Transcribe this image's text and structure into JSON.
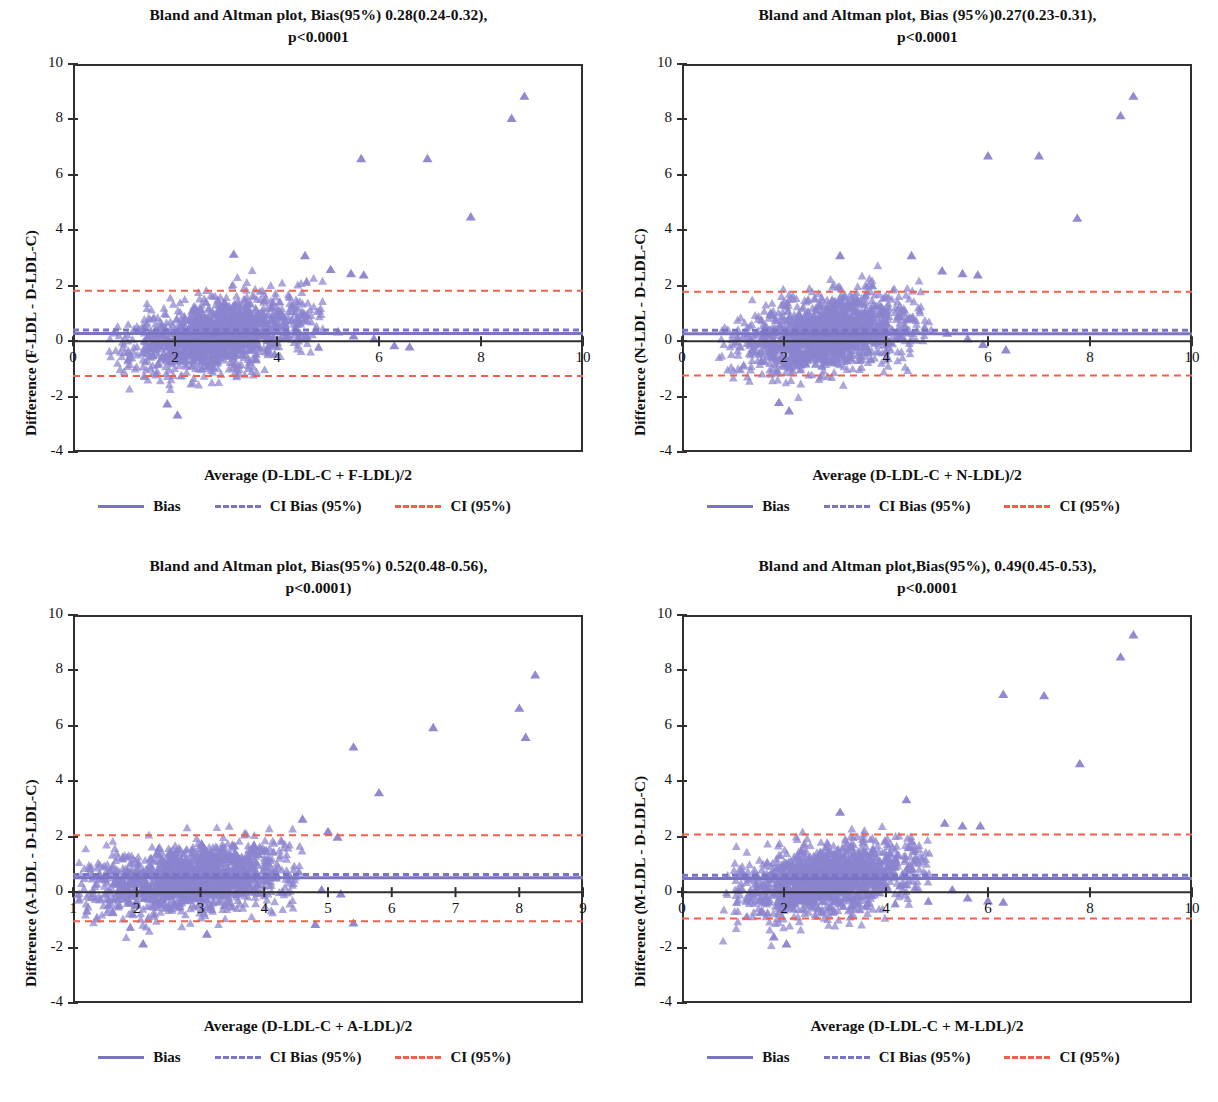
{
  "figure": {
    "panel_count": 4,
    "marker_shape": "triangle",
    "marker_color": "#8b84cf",
    "bias_color": "#7b74c4",
    "ci_bias_color": "#7b74c4",
    "ci_color": "#f0604a",
    "axis_color": "#2f2f33"
  },
  "legend": {
    "items": [
      {
        "label": "Bias",
        "style": "solid",
        "color": "#7b74c4",
        "name": "legend-bias"
      },
      {
        "label": "CI Bias (95%)",
        "style": "dashed",
        "color": "#7b74c4",
        "name": "legend-ci-bias"
      },
      {
        "label": "CI (95%)",
        "style": "dashed",
        "color": "#f0604a",
        "name": "legend-ci"
      }
    ]
  },
  "panels": [
    {
      "id": "f-ldl",
      "title_line1": "Bland and Altman plot, Bias(95%) 0.28(0.24-0.32),",
      "title_line2": "p<0.0001",
      "ylabel": "Difference (F-LDL - D-LDL-C)",
      "xlabel": "Average (D-LDL-C + F-LDL)/2",
      "xticks": [
        0,
        2,
        4,
        6,
        8,
        10
      ],
      "yticks": [
        -4,
        -2,
        0,
        2,
        4,
        6,
        8,
        10
      ],
      "xlim": [
        0,
        10
      ],
      "ylim": [
        -4,
        10
      ],
      "bias": 0.28,
      "bias_ci_low": 0.24,
      "bias_ci_high": 0.32,
      "p_value": "p<0.0001",
      "loa_upper": 1.82,
      "loa_lower": -1.26,
      "cluster": {
        "x_center": 2.9,
        "x_spread": 0.85,
        "x_min": 0.7,
        "x_max": 4.9,
        "slope": 0.3,
        "y_spread": 0.62,
        "n": 1500
      },
      "outliers": [
        {
          "x": 5.65,
          "y": 6.6
        },
        {
          "x": 6.95,
          "y": 6.6
        },
        {
          "x": 7.8,
          "y": 4.5
        },
        {
          "x": 8.6,
          "y": 8.05
        },
        {
          "x": 8.85,
          "y": 8.85
        },
        {
          "x": 5.05,
          "y": 2.6
        },
        {
          "x": 5.45,
          "y": 2.45
        },
        {
          "x": 5.7,
          "y": 2.4
        },
        {
          "x": 5.2,
          "y": 0.35
        },
        {
          "x": 5.5,
          "y": 0.2
        },
        {
          "x": 5.9,
          "y": 0.1
        },
        {
          "x": 6.3,
          "y": -0.15
        },
        {
          "x": 6.6,
          "y": -0.2
        },
        {
          "x": 4.55,
          "y": 3.1
        },
        {
          "x": 3.15,
          "y": 3.15
        },
        {
          "x": 2.05,
          "y": -2.65
        },
        {
          "x": 1.85,
          "y": -2.25
        }
      ]
    },
    {
      "id": "n-ldl",
      "title_line1": "Bland and Altman plot, Bias (95%)0.27(0.23-0.31),",
      "title_line2": "p<0.0001",
      "ylabel": "Difference (N-LDL - D-LDL-C)",
      "xlabel": "Average (D-LDL-C + N-LDL)/2",
      "xticks": [
        0,
        2,
        4,
        6,
        8,
        10
      ],
      "yticks": [
        -4,
        -2,
        0,
        2,
        4,
        6,
        8,
        10
      ],
      "xlim": [
        0,
        10
      ],
      "ylim": [
        -4,
        10
      ],
      "bias": 0.27,
      "bias_ci_low": 0.23,
      "bias_ci_high": 0.31,
      "p_value": "p<0.0001",
      "loa_upper": 1.78,
      "loa_lower": -1.24,
      "cluster": {
        "x_center": 2.85,
        "x_spread": 0.85,
        "x_min": 0.7,
        "x_max": 4.9,
        "slope": 0.3,
        "y_spread": 0.64,
        "n": 1500
      },
      "outliers": [
        {
          "x": 6.0,
          "y": 6.7
        },
        {
          "x": 7.0,
          "y": 6.7
        },
        {
          "x": 7.75,
          "y": 4.45
        },
        {
          "x": 8.6,
          "y": 8.15
        },
        {
          "x": 8.85,
          "y": 8.85
        },
        {
          "x": 5.1,
          "y": 2.55
        },
        {
          "x": 5.5,
          "y": 2.45
        },
        {
          "x": 5.8,
          "y": 2.4
        },
        {
          "x": 5.2,
          "y": 0.3
        },
        {
          "x": 5.6,
          "y": 0.1
        },
        {
          "x": 5.9,
          "y": -0.1
        },
        {
          "x": 6.35,
          "y": -0.3
        },
        {
          "x": 4.5,
          "y": 3.1
        },
        {
          "x": 3.1,
          "y": 3.1
        },
        {
          "x": 2.1,
          "y": -2.5
        },
        {
          "x": 1.9,
          "y": -2.2
        }
      ]
    },
    {
      "id": "a-ldl",
      "title_line1": "Bland and Altman plot, Bias(95%) 0.52(0.48-0.56),",
      "title_line2": "p<0.0001)",
      "ylabel": "Difference (A-LDL - D-LDL-C)",
      "xlabel": "Average (D-LDL-C + A-LDL)/2",
      "xticks": [
        1,
        2,
        3,
        4,
        5,
        6,
        7,
        8,
        9
      ],
      "yticks": [
        -4,
        -2,
        0,
        2,
        4,
        6,
        8,
        10
      ],
      "xlim": [
        1,
        9
      ],
      "ylim": [
        -4,
        10
      ],
      "bias": 0.52,
      "bias_ci_low": 0.48,
      "bias_ci_high": 0.56,
      "p_value": "p<0.0001)",
      "loa_upper": 2.05,
      "loa_lower": -1.05,
      "cluster": {
        "x_center": 2.85,
        "x_spread": 0.82,
        "x_min": 1.05,
        "x_max": 4.6,
        "slope": 0.22,
        "y_spread": 0.6,
        "n": 1500
      },
      "outliers": [
        {
          "x": 5.4,
          "y": 5.25
        },
        {
          "x": 6.65,
          "y": 5.95
        },
        {
          "x": 8.0,
          "y": 6.65
        },
        {
          "x": 8.25,
          "y": 7.85
        },
        {
          "x": 8.1,
          "y": 5.6
        },
        {
          "x": 5.8,
          "y": 3.6
        },
        {
          "x": 4.6,
          "y": 2.65
        },
        {
          "x": 5.0,
          "y": 2.2
        },
        {
          "x": 5.15,
          "y": 2.0
        },
        {
          "x": 4.9,
          "y": 0.1
        },
        {
          "x": 5.2,
          "y": -0.05
        },
        {
          "x": 5.4,
          "y": -1.1
        },
        {
          "x": 4.8,
          "y": -1.15
        },
        {
          "x": 2.1,
          "y": -1.85
        },
        {
          "x": 3.1,
          "y": -1.5
        }
      ]
    },
    {
      "id": "m-ldl",
      "title_line1": "Bland and Altman plot,Bias(95%), 0.49(0.45-0.53),",
      "title_line2": "p<0.0001",
      "ylabel": "Difference (M-LDL - D-LDL-C)",
      "xlabel": "Average (D-LDL-C + M-LDL)/2",
      "xticks": [
        0,
        2,
        4,
        6,
        8,
        10
      ],
      "yticks": [
        -4,
        -2,
        0,
        2,
        4,
        6,
        8,
        10
      ],
      "xlim": [
        0,
        10
      ],
      "ylim": [
        -4,
        10
      ],
      "bias": 0.49,
      "bias_ci_low": 0.45,
      "bias_ci_high": 0.53,
      "p_value": "p<0.0001",
      "loa_upper": 2.08,
      "loa_lower": -0.95,
      "cluster": {
        "x_center": 2.9,
        "x_spread": 0.85,
        "x_min": 0.75,
        "x_max": 4.85,
        "slope": 0.24,
        "y_spread": 0.62,
        "n": 1500
      },
      "outliers": [
        {
          "x": 6.3,
          "y": 7.15
        },
        {
          "x": 7.1,
          "y": 7.1
        },
        {
          "x": 7.8,
          "y": 4.65
        },
        {
          "x": 8.6,
          "y": 8.5
        },
        {
          "x": 8.85,
          "y": 9.3
        },
        {
          "x": 5.15,
          "y": 2.5
        },
        {
          "x": 5.5,
          "y": 2.4
        },
        {
          "x": 5.85,
          "y": 2.4
        },
        {
          "x": 5.3,
          "y": 0.1
        },
        {
          "x": 5.6,
          "y": -0.2
        },
        {
          "x": 6.0,
          "y": -0.3
        },
        {
          "x": 6.3,
          "y": -0.35
        },
        {
          "x": 4.4,
          "y": 3.35
        },
        {
          "x": 3.1,
          "y": 2.9
        },
        {
          "x": 2.05,
          "y": -1.85
        },
        {
          "x": 1.8,
          "y": -1.6
        }
      ]
    }
  ]
}
